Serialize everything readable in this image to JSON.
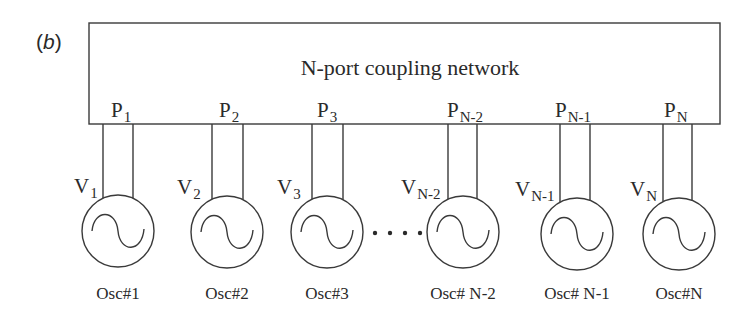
{
  "panel_label": {
    "open": "(",
    "letter": "b",
    "close": ")"
  },
  "network": {
    "title": "N-port coupling network"
  },
  "ports": [
    {
      "base": "P",
      "sub": "1",
      "x1": 103,
      "x2": 133,
      "label_x": 111
    },
    {
      "base": "P",
      "sub": "2",
      "x1": 212,
      "x2": 243,
      "label_x": 219
    },
    {
      "base": "P",
      "sub": "3",
      "x1": 312,
      "x2": 343,
      "label_x": 317
    },
    {
      "base": "P",
      "sub": "N-2",
      "x1": 448,
      "x2": 477,
      "label_x": 447
    },
    {
      "base": "P",
      "sub": "N-1",
      "x1": 560,
      "x2": 590,
      "label_x": 555
    },
    {
      "base": "P",
      "sub": "N",
      "x1": 663,
      "x2": 692,
      "label_x": 664
    }
  ],
  "oscillators": [
    {
      "name": "Osc#1",
      "v_base": "V",
      "v_sub": "1",
      "cx": 118,
      "cy": 231,
      "v_x": 74
    },
    {
      "name": "Osc#2",
      "v_base": "V",
      "v_sub": "2",
      "cx": 227,
      "cy": 232,
      "v_x": 177
    },
    {
      "name": "Osc#3",
      "v_base": "V",
      "v_sub": "3",
      "cx": 327,
      "cy": 232,
      "v_x": 277
    },
    {
      "name": "Osc# N-2",
      "v_base": "V",
      "v_sub": "N-2",
      "cx": 463,
      "cy": 232,
      "v_x": 401
    },
    {
      "name": "Osc# N-1",
      "v_base": "V",
      "v_sub": "N-1",
      "cx": 577,
      "cy": 234,
      "v_x": 515
    },
    {
      "name": "Osc#N",
      "v_base": "V",
      "v_sub": "N",
      "cx": 679,
      "cy": 234,
      "v_x": 630
    }
  ],
  "ellipsis": {
    "dots": [
      375,
      390,
      405,
      420
    ],
    "y": 233
  }
}
